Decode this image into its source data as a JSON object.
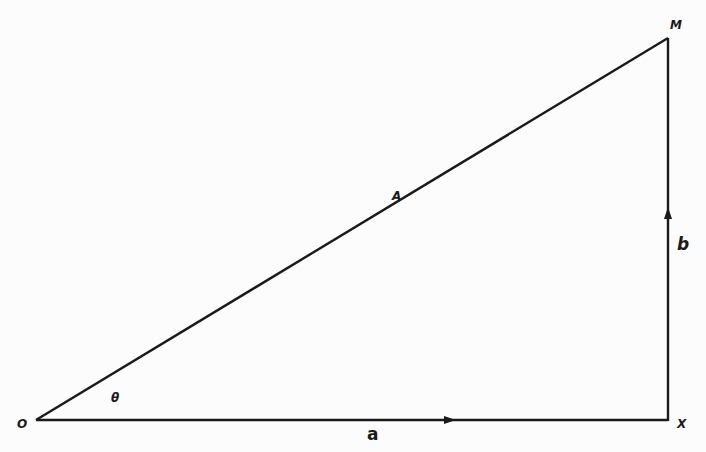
{
  "diagram": {
    "type": "right-triangle-vector-diagram",
    "line_color": "#1a1a1a",
    "background": "#fcfcfc",
    "points": {
      "O": {
        "label": "O",
        "x": 36,
        "y": 420
      },
      "X": {
        "label": "X",
        "x": 668,
        "y": 420
      },
      "M": {
        "label": "M",
        "x": 668,
        "y": 38
      }
    },
    "edges": [
      {
        "from": "O",
        "to": "X",
        "label": "a",
        "arrow": "right"
      },
      {
        "from": "X",
        "to": "M",
        "label": "b",
        "arrow": "up"
      },
      {
        "from": "O",
        "to": "M",
        "label": "A",
        "arrow": "none"
      }
    ],
    "labels": {
      "origin": "O",
      "x_point": "X",
      "m_point": "M",
      "angle": "θ",
      "hypotenuse": "A",
      "horizontal": "a",
      "vertical": "b"
    }
  }
}
